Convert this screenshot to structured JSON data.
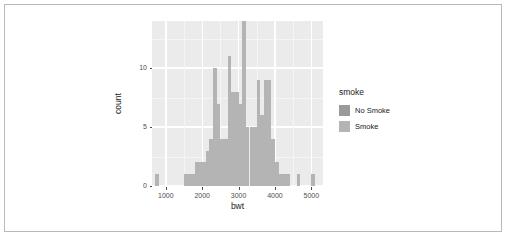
{
  "chart_data": {
    "type": "bar",
    "subtype": "histogram-overlaid",
    "title": "",
    "xlabel": "bwt",
    "ylabel": "count",
    "xlim": [
      620,
      5320
    ],
    "ylim": [
      0,
      14
    ],
    "xticks": [
      1000,
      2000,
      3000,
      4000,
      5000
    ],
    "yticks": [
      0,
      5,
      10
    ],
    "grid": true,
    "binwidth": 100,
    "legend": {
      "title": "smoke",
      "position": "right",
      "entries": [
        {
          "name": "No Smoke",
          "color": "#9a9a9a"
        },
        {
          "name": "Smoke",
          "color": "#b4b4b4"
        }
      ]
    },
    "series": [
      {
        "name": "No Smoke",
        "color": "#9a9a9a",
        "bins": [
          {
            "x": 700,
            "count": 1
          },
          {
            "x": 1500,
            "count": 1
          },
          {
            "x": 1600,
            "count": 1
          },
          {
            "x": 1700,
            "count": 1
          },
          {
            "x": 1800,
            "count": 2
          },
          {
            "x": 1900,
            "count": 2
          },
          {
            "x": 2000,
            "count": 2
          },
          {
            "x": 2100,
            "count": 3
          },
          {
            "x": 2200,
            "count": 4
          },
          {
            "x": 2300,
            "count": 4
          },
          {
            "x": 2400,
            "count": 4
          },
          {
            "x": 2500,
            "count": 4
          },
          {
            "x": 2600,
            "count": 4
          },
          {
            "x": 2700,
            "count": 5
          },
          {
            "x": 2800,
            "count": 5
          },
          {
            "x": 2900,
            "count": 5
          },
          {
            "x": 3000,
            "count": 5
          },
          {
            "x": 3100,
            "count": 5
          },
          {
            "x": 3200,
            "count": 5
          },
          {
            "x": 3300,
            "count": 5
          },
          {
            "x": 3400,
            "count": 5
          },
          {
            "x": 3500,
            "count": 4
          },
          {
            "x": 3600,
            "count": 4
          },
          {
            "x": 3700,
            "count": 4
          },
          {
            "x": 3800,
            "count": 4
          },
          {
            "x": 3900,
            "count": 4
          },
          {
            "x": 4000,
            "count": 2
          },
          {
            "x": 4100,
            "count": 1
          },
          {
            "x": 4200,
            "count": 1
          },
          {
            "x": 4300,
            "count": 1
          },
          {
            "x": 4600,
            "count": 1
          },
          {
            "x": 5000,
            "count": 1
          }
        ]
      },
      {
        "name": "Smoke",
        "color": "#b4b4b4",
        "bins": [
          {
            "x": 700,
            "count": 1
          },
          {
            "x": 1500,
            "count": 1
          },
          {
            "x": 1600,
            "count": 1
          },
          {
            "x": 1700,
            "count": 1
          },
          {
            "x": 1800,
            "count": 2
          },
          {
            "x": 1900,
            "count": 2
          },
          {
            "x": 2000,
            "count": 2
          },
          {
            "x": 2100,
            "count": 3
          },
          {
            "x": 2200,
            "count": 4
          },
          {
            "x": 2300,
            "count": 10
          },
          {
            "x": 2400,
            "count": 7
          },
          {
            "x": 2500,
            "count": 4
          },
          {
            "x": 2600,
            "count": 4
          },
          {
            "x": 2700,
            "count": 11
          },
          {
            "x": 2800,
            "count": 8
          },
          {
            "x": 2900,
            "count": 8
          },
          {
            "x": 3000,
            "count": 7
          },
          {
            "x": 3100,
            "count": 14
          },
          {
            "x": 3200,
            "count": 5
          },
          {
            "x": 3300,
            "count": 5
          },
          {
            "x": 3400,
            "count": 5
          },
          {
            "x": 3500,
            "count": 9
          },
          {
            "x": 3600,
            "count": 6
          },
          {
            "x": 3700,
            "count": 9
          },
          {
            "x": 3800,
            "count": 9
          },
          {
            "x": 3900,
            "count": 4
          },
          {
            "x": 4000,
            "count": 2
          },
          {
            "x": 4100,
            "count": 1
          },
          {
            "x": 4200,
            "count": 1
          },
          {
            "x": 4300,
            "count": 1
          },
          {
            "x": 4600,
            "count": 1
          },
          {
            "x": 5000,
            "count": 1
          }
        ]
      }
    ]
  }
}
